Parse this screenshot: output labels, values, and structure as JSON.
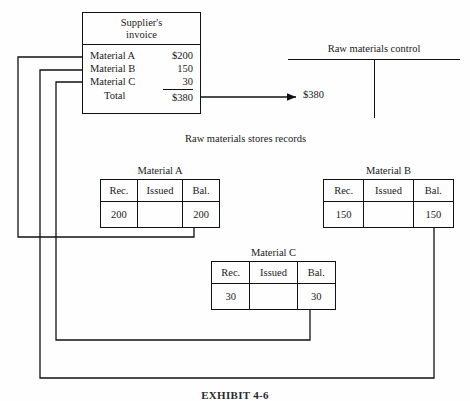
{
  "invoice": {
    "title_line1": "Supplier's",
    "title_line2": "invoice",
    "rows": [
      {
        "label": "Material A",
        "amount": "$200"
      },
      {
        "label": "Material B",
        "amount": "150"
      },
      {
        "label": "Material C",
        "amount": "30"
      }
    ],
    "total_label": "Total",
    "total_amount": "$380"
  },
  "control_account": {
    "title": "Raw materials control",
    "debit_amount": "$380"
  },
  "stores_records": {
    "caption": "Raw materials stores records",
    "columns": [
      "Rec.",
      "Issued",
      "Bal."
    ],
    "tables": [
      {
        "title": "Material A",
        "received": "200",
        "issued": "",
        "balance": "200"
      },
      {
        "title": "Material B",
        "received": "150",
        "issued": "",
        "balance": "150"
      },
      {
        "title": "Material C",
        "received": "30",
        "issued": "",
        "balance": "30"
      }
    ]
  },
  "exhibit": {
    "caption": "EXHIBIT 4-6"
  },
  "colors": {
    "ink": "#111111",
    "paper": "#fefefe"
  }
}
